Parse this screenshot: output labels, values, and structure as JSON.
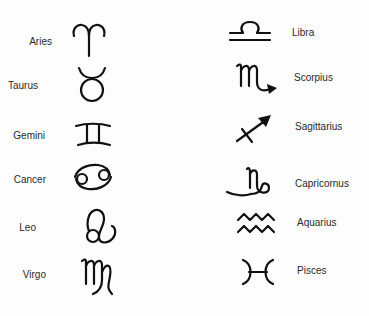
{
  "ink_color": "#111111",
  "left_column": [
    {
      "name": "Aries",
      "icon": "aries-icon"
    },
    {
      "name": "Taurus",
      "icon": "taurus-icon"
    },
    {
      "name": "Gemini",
      "icon": "gemini-icon"
    },
    {
      "name": "Cancer",
      "icon": "cancer-icon"
    },
    {
      "name": "Leo",
      "icon": "leo-icon"
    },
    {
      "name": "Virgo",
      "icon": "virgo-icon"
    }
  ],
  "right_column": [
    {
      "name": "Libra",
      "icon": "libra-icon"
    },
    {
      "name": "Scorpius",
      "icon": "scorpius-icon"
    },
    {
      "name": "Sagittarius",
      "icon": "sagittarius-icon"
    },
    {
      "name": "Capricornus",
      "icon": "capricornus-icon"
    },
    {
      "name": "Aquarius",
      "icon": "aquarius-icon"
    },
    {
      "name": "Pisces",
      "icon": "pisces-icon"
    }
  ]
}
